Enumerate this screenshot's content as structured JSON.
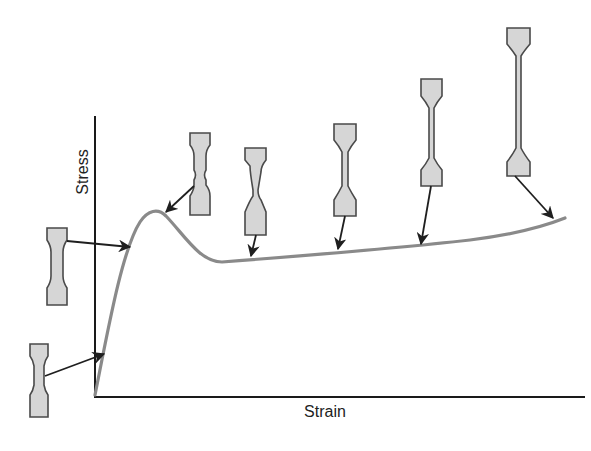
{
  "diagram": {
    "axes": {
      "x_label": "Strain",
      "y_label": "Stress"
    },
    "curve": {
      "description": "Linear elastic rise to upper yield peak, drop to lower yield, then gradual rise during neck propagation",
      "color": "#8a8a8a"
    },
    "specimens": [
      {
        "stage": "elastic",
        "description": "undeformed specimen"
      },
      {
        "stage": "pre-yield",
        "description": "uniform specimen near yield"
      },
      {
        "stage": "upper-yield",
        "description": "neck begins to form"
      },
      {
        "stage": "lower-yield",
        "description": "neck established"
      },
      {
        "stage": "neck-propagation-1",
        "description": "neck extends"
      },
      {
        "stage": "neck-propagation-2",
        "description": "neck extends further"
      },
      {
        "stage": "near-fracture",
        "description": "neck spans full gauge length"
      }
    ],
    "colors": {
      "specimen_fill": "#d6d6d6",
      "outline": "#4a4a4a"
    }
  }
}
